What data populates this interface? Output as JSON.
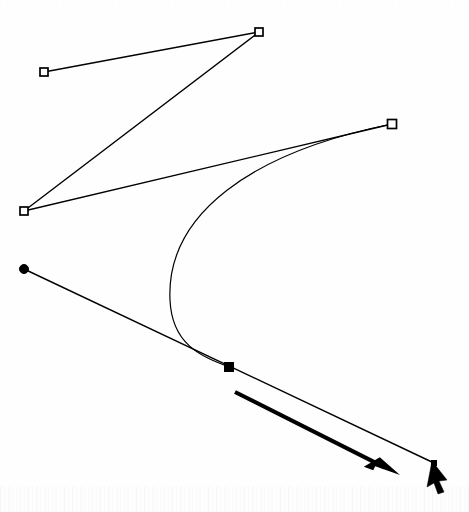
{
  "figure": {
    "kind": "bezier-curve-editing-diagram",
    "background_color": "#ffffff",
    "stroke_color": "#000000",
    "width": 469,
    "height": 512
  },
  "curve": {
    "name": "bezier-curve",
    "start": {
      "x": 392,
      "y": 124
    },
    "control1": {
      "x": 180,
      "y": 186
    },
    "control2": {
      "x": 150,
      "y": 330
    },
    "end": {
      "x": 229,
      "y": 367
    },
    "stroke_width": 1.2,
    "leftmost_x": 170
  },
  "path_line": {
    "name": "tangent-line",
    "from": {
      "x": 24,
      "y": 269
    },
    "through": {
      "x": 229,
      "y": 367
    },
    "to": {
      "x": 434,
      "y": 463
    },
    "stroke_width": 1.4
  },
  "handle_polyline": {
    "name": "control-handle-polyline",
    "points": [
      {
        "x": 44,
        "y": 72
      },
      {
        "x": 259,
        "y": 32
      },
      {
        "x": 24,
        "y": 211
      },
      {
        "x": 392,
        "y": 124
      }
    ],
    "stroke_width": 1.4
  },
  "nodes": [
    {
      "id": "handle-1",
      "type": "square-hollow",
      "label": "control handle 1",
      "x": 44,
      "y": 72,
      "size": 8
    },
    {
      "id": "handle-2",
      "type": "square-hollow",
      "label": "control handle 2",
      "x": 259,
      "y": 32,
      "size": 8
    },
    {
      "id": "handle-3",
      "type": "square-hollow",
      "label": "control handle 3",
      "x": 24,
      "y": 211,
      "size": 8
    },
    {
      "id": "handle-4",
      "type": "square-hollow",
      "label": "control handle 4",
      "x": 392,
      "y": 124,
      "size": 9
    },
    {
      "id": "anchor-start",
      "type": "circle-filled",
      "label": "start anchor point",
      "x": 24,
      "y": 269,
      "size": 9
    },
    {
      "id": "anchor-selected",
      "type": "square-filled",
      "label": "selected anchor point",
      "x": 229,
      "y": 367,
      "size": 9
    },
    {
      "id": "anchor-end",
      "type": "square-filled-small",
      "label": "end anchor point",
      "x": 434,
      "y": 463,
      "size": 5
    }
  ],
  "direction_arrow": {
    "name": "direction-arrow",
    "from": {
      "x": 235,
      "y": 392
    },
    "to": {
      "x": 400,
      "y": 475
    },
    "stroke_width": 4,
    "head_length": 26,
    "head_width": 15
  },
  "cursor": {
    "name": "mouse-pointer",
    "tip": {
      "x": 432,
      "y": 461
    },
    "points": "432,461 447,480 439,481 444,492 438,494 434,483 427,487"
  }
}
